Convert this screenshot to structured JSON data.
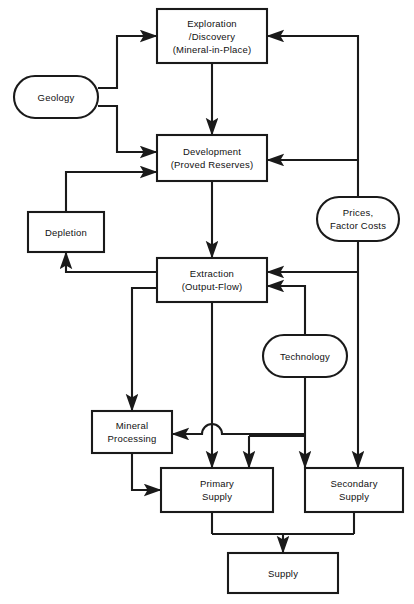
{
  "diagram": {
    "background_color": "#ffffff",
    "line_color": "#1a1a1a",
    "text_color": "#111111",
    "nodes": [
      {
        "id": "exploration",
        "shape": "rect",
        "label": "Exploration\n/Discovery\n(Mineral-in-Place)",
        "x": 157,
        "y": 9,
        "w": 110,
        "h": 54
      },
      {
        "id": "geology",
        "shape": "oval",
        "label": "Geology",
        "x": 14,
        "y": 76,
        "w": 84,
        "h": 42
      },
      {
        "id": "development",
        "shape": "rect",
        "label": "Development\n(Proved Reserves)",
        "x": 157,
        "y": 135,
        "w": 110,
        "h": 46
      },
      {
        "id": "depletion",
        "shape": "rect",
        "label": "Depletion",
        "x": 28,
        "y": 212,
        "w": 76,
        "h": 40
      },
      {
        "id": "prices",
        "shape": "oval",
        "label": "Prices,\nFactor Costs",
        "x": 317,
        "y": 197,
        "w": 82,
        "h": 44
      },
      {
        "id": "extraction",
        "shape": "rect",
        "label": "Extraction\n(Output-Flow)",
        "x": 157,
        "y": 258,
        "w": 110,
        "h": 44
      },
      {
        "id": "technology",
        "shape": "oval",
        "label": "Technology",
        "x": 263,
        "y": 335,
        "w": 84,
        "h": 42
      },
      {
        "id": "mineral-processing",
        "shape": "rect",
        "label": "Mineral\nProcessing",
        "x": 92,
        "y": 411,
        "w": 80,
        "h": 42
      },
      {
        "id": "primary-supply",
        "shape": "rect",
        "label": "Primary\nSupply",
        "x": 161,
        "y": 468,
        "w": 112,
        "h": 44
      },
      {
        "id": "secondary-supply",
        "shape": "rect",
        "label": "Secondary\nSupply",
        "x": 305,
        "y": 468,
        "w": 98,
        "h": 44
      },
      {
        "id": "supply",
        "shape": "rect",
        "label": "Supply",
        "x": 228,
        "y": 553,
        "w": 110,
        "h": 40
      }
    ]
  }
}
